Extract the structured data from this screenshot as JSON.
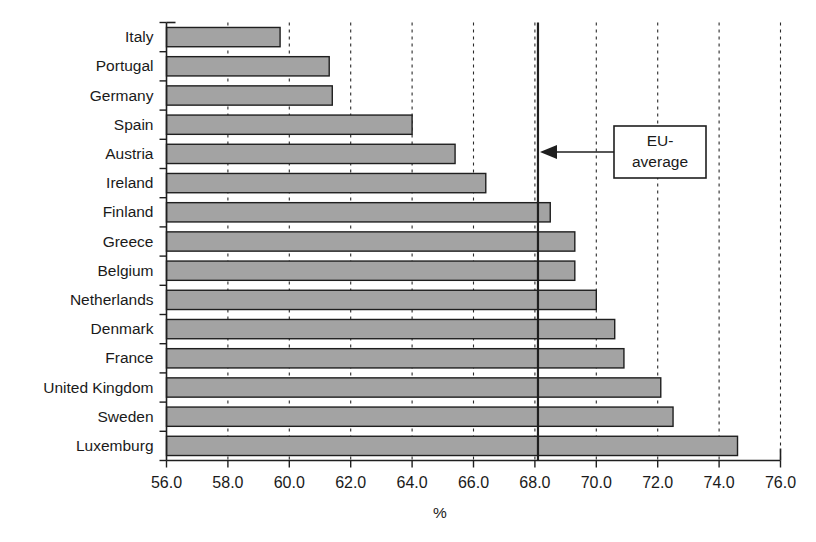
{
  "chart_data": {
    "type": "bar",
    "orientation": "horizontal",
    "title": "",
    "xlabel": "%",
    "ylabel": "",
    "xlim": [
      56.0,
      76.0
    ],
    "xticks": [
      "56.0",
      "58.0",
      "60.0",
      "62.0",
      "64.0",
      "66.0",
      "68.0",
      "70.0",
      "72.0",
      "74.0",
      "76.0"
    ],
    "xtick_values": [
      56,
      58,
      60,
      62,
      64,
      66,
      68,
      70,
      72,
      74,
      76
    ],
    "grid": "vertical-dashed",
    "legend": "none",
    "categories": [
      "Italy",
      "Portugal",
      "Germany",
      "Spain",
      "Austria",
      "Ireland",
      "Finland",
      "Greece",
      "Belgium",
      "Netherlands",
      "Denmark",
      "France",
      "United Kingdom",
      "Sweden",
      "Luxemburg"
    ],
    "values": [
      59.7,
      61.3,
      61.4,
      64.0,
      65.4,
      66.4,
      68.5,
      69.3,
      69.3,
      70.0,
      70.6,
      70.9,
      72.1,
      72.5,
      74.6
    ],
    "bar_fill_color": "#a3a3a3",
    "bar_edge_color": "#1f1f1f",
    "annotations": [
      {
        "label": "EU-\naverage",
        "label_line1": "EU-",
        "label_line2": "average",
        "reference_value": 68.1,
        "type": "reference-line-with-callout"
      }
    ]
  },
  "axis": {
    "x_title": "%"
  }
}
